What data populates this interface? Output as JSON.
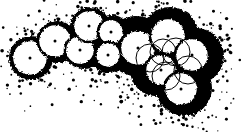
{
  "figure": {
    "width": 242,
    "height": 132,
    "background_color": "#ffffff",
    "ink_color": "#000000",
    "outline_color": "#000000",
    "sphere_fill_color": "#ffffff",
    "stipple_color": "#000000"
  },
  "chart_data": {
    "type": "scatter",
    "xlabel": "",
    "ylabel": "",
    "xlim": [
      0,
      242
    ],
    "ylim": [
      0,
      132
    ],
    "grid": false,
    "legend": null,
    "series": [
      {
        "name": "outlined-spheres",
        "values": [
          {
            "cx": 30,
            "cy": 58,
            "r": 18,
            "outline": "thick",
            "center_dot": true
          },
          {
            "cx": 55,
            "cy": 41,
            "r": 17,
            "outline": "thick",
            "center_dot": true
          },
          {
            "cx": 80,
            "cy": 50,
            "r": 15,
            "outline": "thick",
            "center_dot": true
          },
          {
            "cx": 89,
            "cy": 26,
            "r": 16,
            "outline": "thick",
            "center_dot": true
          },
          {
            "cx": 111,
            "cy": 32,
            "r": 13,
            "outline": "thick",
            "center_dot": true
          },
          {
            "cx": 108,
            "cy": 55,
            "r": 13,
            "outline": "thick",
            "center_dot": true
          },
          {
            "cx": 138,
            "cy": 48,
            "r": 18,
            "outline": "thick",
            "center_dot": true
          },
          {
            "cx": 168,
            "cy": 36,
            "r": 18,
            "outline": "thick",
            "center_dot": true
          },
          {
            "cx": 192,
            "cy": 55,
            "r": 17,
            "outline": "thick",
            "center_dot": true
          },
          {
            "cx": 161,
            "cy": 70,
            "r": 16,
            "outline": "thick",
            "center_dot": true
          },
          {
            "cx": 181,
            "cy": 89,
            "r": 17,
            "outline": "thick",
            "center_dot": true
          }
        ]
      },
      {
        "name": "thin-overlay-circles",
        "values": [
          {
            "cx": 150,
            "cy": 58,
            "r": 14
          },
          {
            "cx": 176,
            "cy": 52,
            "r": 14
          },
          {
            "cx": 166,
            "cy": 76,
            "r": 14
          },
          {
            "cx": 188,
            "cy": 70,
            "r": 14
          },
          {
            "cx": 163,
            "cy": 52,
            "r": 13
          }
        ]
      },
      {
        "name": "dark-matrix-lobes",
        "values": [
          {
            "cx": 136,
            "cy": 46,
            "r": 30
          },
          {
            "cx": 170,
            "cy": 36,
            "r": 29
          },
          {
            "cx": 196,
            "cy": 56,
            "r": 28
          },
          {
            "cx": 184,
            "cy": 88,
            "r": 28
          },
          {
            "cx": 156,
            "cy": 70,
            "r": 26
          },
          {
            "cx": 108,
            "cy": 52,
            "r": 21
          },
          {
            "cx": 84,
            "cy": 49,
            "r": 20
          },
          {
            "cx": 57,
            "cy": 42,
            "r": 21
          },
          {
            "cx": 31,
            "cy": 58,
            "r": 22
          },
          {
            "cx": 90,
            "cy": 27,
            "r": 20
          },
          {
            "cx": 112,
            "cy": 32,
            "r": 17
          }
        ]
      },
      {
        "name": "stipple-dots",
        "point_count": 210,
        "radius_range": [
          0.6,
          1.8
        ],
        "distribution": "clustered around aggregate perimeter"
      }
    ]
  },
  "labels": {
    "alt_text": "Chain of overlapping white spheres outlined in black with stipple shading"
  }
}
